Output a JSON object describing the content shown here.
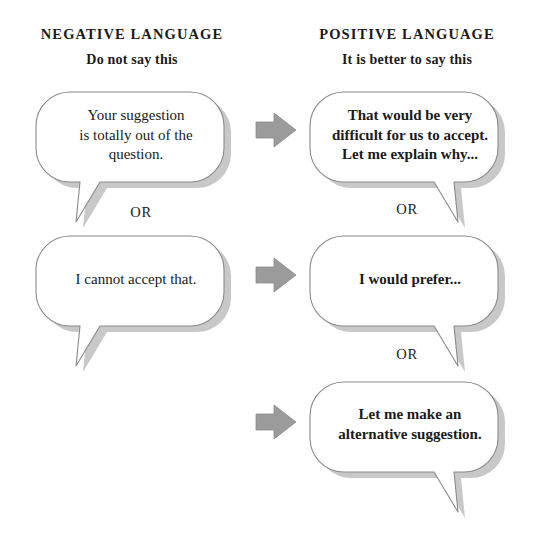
{
  "columns": {
    "negative": {
      "heading": "NEGATIVE LANGUAGE",
      "subheading": "Do not say this"
    },
    "positive": {
      "heading": "POSITIVE LANGUAGE",
      "subheading": "It is better to say this"
    }
  },
  "bubbles": {
    "neg1": "Your suggestion\nis totally out of the\nquestion.",
    "neg2": "I cannot accept that.",
    "pos1": "That would be very\ndifficult for us to accept.\nLet me explain why...",
    "pos2": "I would prefer...",
    "pos3": "Let me make an\nalternative suggestion."
  },
  "separators": {
    "neg_or_1": "OR",
    "pos_or_1": "OR",
    "pos_or_2": "OR"
  },
  "icons": {
    "arrow_1": "arrow-right-icon",
    "arrow_2": "arrow-right-icon",
    "arrow_3": "arrow-right-icon"
  },
  "colors": {
    "background": "#ffffff",
    "text": "#1a1a1a",
    "bubble_fill": "#ffffff",
    "bubble_stroke": "#8a8a8a",
    "bubble_shadow": "#9a9a9a",
    "arrow_fill": "#9b9b9b",
    "arrow_stroke": "#8a8a8a"
  }
}
